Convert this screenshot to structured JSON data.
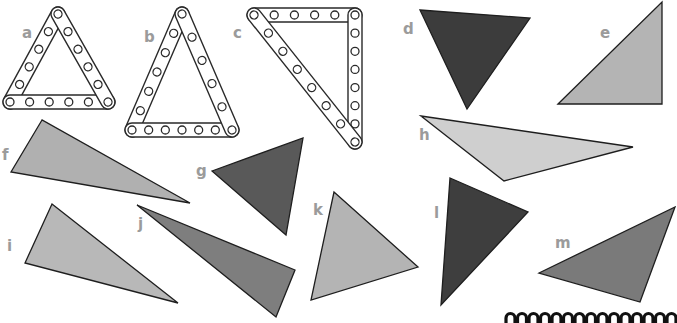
{
  "figure": {
    "rod_triangles": [
      {
        "id": "a",
        "label": "a",
        "label_pos": [
          22,
          38
        ],
        "vertices": [
          [
            58,
            14
          ],
          [
            10,
            102
          ],
          [
            108,
            102
          ]
        ],
        "holes_per_side": 5
      },
      {
        "id": "b",
        "label": "b",
        "label_pos": [
          144,
          42
        ],
        "vertices": [
          [
            182,
            14
          ],
          [
            132,
            130
          ],
          [
            232,
            130
          ]
        ],
        "holes_per_side": [
          6,
          6,
          5
        ]
      },
      {
        "id": "c",
        "label": "c",
        "label_pos": [
          233,
          38
        ],
        "vertices": [
          [
            254,
            15
          ],
          [
            355,
            15
          ],
          [
            355,
            142
          ]
        ],
        "holes_per_side": [
          5,
          7,
          7
        ]
      }
    ],
    "shape_triangles": [
      {
        "id": "d",
        "label": "d",
        "label_pos": [
          403,
          34
        ],
        "fill": "#3c3c3c",
        "points": [
          [
            420,
            10
          ],
          [
            530,
            18
          ],
          [
            467,
            109
          ]
        ]
      },
      {
        "id": "e",
        "label": "e",
        "label_pos": [
          600,
          38
        ],
        "fill": "#b4b4b4",
        "points": [
          [
            558,
            104
          ],
          [
            662,
            2
          ],
          [
            662,
            104
          ]
        ]
      },
      {
        "id": "f",
        "label": "f",
        "label_pos": [
          2,
          160
        ],
        "fill": "#b0b0b0",
        "points": [
          [
            42,
            120
          ],
          [
            11,
            172
          ],
          [
            190,
            203
          ]
        ]
      },
      {
        "id": "g",
        "label": "g",
        "label_pos": [
          196,
          176
        ],
        "fill": "#595959",
        "points": [
          [
            212,
            171
          ],
          [
            303,
            138
          ],
          [
            286,
            235
          ]
        ]
      },
      {
        "id": "h",
        "label": "h",
        "label_pos": [
          419,
          140
        ],
        "fill": "#cfcfcf",
        "points": [
          [
            421,
            116
          ],
          [
            633,
            147
          ],
          [
            504,
            181
          ]
        ]
      },
      {
        "id": "i",
        "label": "i",
        "label_pos": [
          7,
          251
        ],
        "fill": "#b8b8b8",
        "points": [
          [
            52,
            204
          ],
          [
            25,
            263
          ],
          [
            178,
            303
          ]
        ]
      },
      {
        "id": "j",
        "label": "j",
        "label_pos": [
          138,
          229
        ],
        "fill": "#7e7e7e",
        "points": [
          [
            137,
            205
          ],
          [
            295,
            270
          ],
          [
            276,
            317
          ]
        ]
      },
      {
        "id": "k",
        "label": "k",
        "label_pos": [
          313,
          215
        ],
        "fill": "#b4b4b4",
        "points": [
          [
            334,
            192
          ],
          [
            311,
            300
          ],
          [
            418,
            267
          ]
        ]
      },
      {
        "id": "l",
        "label": "l",
        "label_pos": [
          434,
          218
        ],
        "fill": "#3e3e3e",
        "points": [
          [
            450,
            178
          ],
          [
            528,
            212
          ],
          [
            441,
            305
          ]
        ]
      },
      {
        "id": "m",
        "label": "m",
        "label_pos": [
          555,
          248
        ],
        "fill": "#7a7a7a",
        "points": [
          [
            539,
            273
          ],
          [
            675,
            207
          ],
          [
            640,
            302
          ]
        ]
      }
    ],
    "coil": {
      "x_start": 506,
      "y": 318,
      "loops": 15,
      "spacing": 11.5
    }
  }
}
